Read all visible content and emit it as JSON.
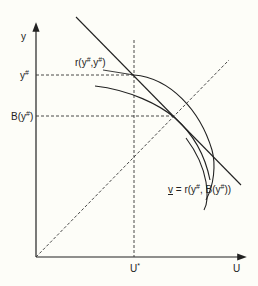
{
  "diagram": {
    "type": "economic-diagram",
    "axes": {
      "x_label": "U",
      "y_label": "y"
    },
    "labels": {
      "y_sharp": {
        "base": "y",
        "sup": "#"
      },
      "b_y_sharp": {
        "prefix": "B(y",
        "sup": "#",
        "suffix": ")"
      },
      "u_star": {
        "base": "U",
        "sup": "*"
      },
      "r_point": {
        "prefix": "r(y",
        "sup1": "#",
        "mid": ",y",
        "sup2": "#",
        "suffix": ")"
      },
      "v_curve": {
        "v": "v",
        "eq": " = r(y",
        "sup1": "#",
        "mid": ", B(y",
        "sup2": "#",
        "suffix": "))"
      }
    },
    "colors": {
      "background": "#fdfdf8",
      "ink": "#222222"
    }
  }
}
